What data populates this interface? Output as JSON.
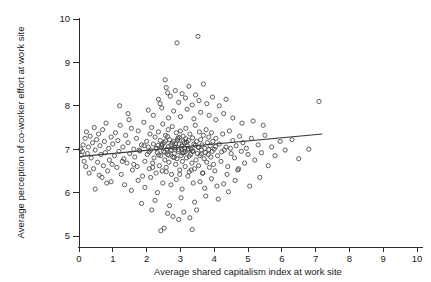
{
  "chart_data": {
    "type": "scatter",
    "title": "",
    "xlabel": "Average shared capitalism index at work site",
    "ylabel": "Average perception of co-worker effort at work site",
    "xlim": [
      0,
      10
    ],
    "ylim": [
      5,
      10
    ],
    "xticks": [
      0,
      1,
      2,
      3,
      4,
      5,
      6,
      7,
      8,
      9,
      10
    ],
    "yticks": [
      5,
      6,
      7,
      8,
      9,
      10
    ],
    "xticklabels": [
      "0",
      "1",
      "2",
      "3",
      "4",
      "5",
      "6",
      "7",
      "8",
      "9",
      "10"
    ],
    "yticklabels": [
      "5",
      "6",
      "7",
      "8",
      "9",
      "10"
    ],
    "grid": false,
    "legend": "none",
    "marker": "open-circle",
    "marker_color": "#3a3a3a",
    "marker_radius_px": 2.1,
    "fit_line": {
      "label": "linear fit",
      "color": "#3a3a3a",
      "x_start": 0.0,
      "y_start": 6.83,
      "x_end": 7.2,
      "y_end": 7.35,
      "slope": 0.072,
      "intercept": 6.83
    },
    "n_points": 352,
    "points": [
      [
        0.05,
        7.0
      ],
      [
        0.07,
        6.86
      ],
      [
        0.1,
        6.95
      ],
      [
        0.12,
        7.1
      ],
      [
        0.15,
        6.72
      ],
      [
        0.18,
        7.25
      ],
      [
        0.2,
        6.6
      ],
      [
        0.22,
        7.4
      ],
      [
        0.25,
        6.9
      ],
      [
        0.28,
        7.05
      ],
      [
        0.3,
        6.45
      ],
      [
        0.33,
        7.3
      ],
      [
        0.36,
        6.8
      ],
      [
        0.4,
        7.15
      ],
      [
        0.43,
        6.55
      ],
      [
        0.45,
        7.5
      ],
      [
        0.48,
        6.98
      ],
      [
        0.52,
        7.22
      ],
      [
        0.55,
        6.7
      ],
      [
        0.58,
        7.35
      ],
      [
        0.6,
        6.4
      ],
      [
        0.62,
        7.08
      ],
      [
        0.65,
        6.88
      ],
      [
        0.7,
        7.45
      ],
      [
        0.72,
        6.62
      ],
      [
        0.75,
        7.18
      ],
      [
        0.78,
        6.92
      ],
      [
        0.8,
        7.6
      ],
      [
        0.85,
        6.5
      ],
      [
        0.88,
        7.02
      ],
      [
        0.9,
        6.75
      ],
      [
        0.95,
        7.28
      ],
      [
        0.98,
        6.65
      ],
      [
        1.0,
        7.12
      ],
      [
        1.05,
        6.85
      ],
      [
        1.08,
        7.38
      ],
      [
        1.12,
        6.58
      ],
      [
        1.15,
        7.2
      ],
      [
        1.18,
        6.95
      ],
      [
        1.22,
        7.55
      ],
      [
        1.25,
        6.42
      ],
      [
        1.3,
        7.05
      ],
      [
        1.33,
        6.78
      ],
      [
        1.38,
        7.32
      ],
      [
        1.42,
        6.68
      ],
      [
        1.45,
        7.15
      ],
      [
        1.5,
        6.9
      ],
      [
        1.55,
        7.48
      ],
      [
        1.58,
        6.52
      ],
      [
        1.62,
        7.0
      ],
      [
        1.65,
        6.82
      ],
      [
        1.7,
        7.25
      ],
      [
        1.72,
        6.6
      ],
      [
        1.75,
        7.42
      ],
      [
        1.8,
        6.96
      ],
      [
        1.85,
        7.1
      ],
      [
        1.88,
        6.38
      ],
      [
        1.92,
        7.62
      ],
      [
        1.95,
        6.72
      ],
      [
        2.0,
        7.18
      ],
      [
        2.02,
        6.88
      ],
      [
        2.05,
        7.05
      ],
      [
        2.08,
        6.55
      ],
      [
        2.1,
        7.35
      ],
      [
        2.12,
        6.98
      ],
      [
        2.15,
        7.5
      ],
      [
        2.18,
        6.68
      ],
      [
        2.2,
        7.12
      ],
      [
        2.22,
        6.8
      ],
      [
        2.25,
        7.28
      ],
      [
        2.28,
        6.45
      ],
      [
        2.3,
        7.02
      ],
      [
        2.32,
        6.92
      ],
      [
        2.35,
        7.4
      ],
      [
        2.38,
        6.62
      ],
      [
        2.4,
        7.2
      ],
      [
        2.42,
        6.85
      ],
      [
        2.45,
        7.08
      ],
      [
        2.46,
        6.5
      ],
      [
        2.48,
        7.58
      ],
      [
        2.5,
        6.95
      ],
      [
        2.52,
        7.15
      ],
      [
        2.54,
        6.75
      ],
      [
        2.56,
        7.32
      ],
      [
        2.58,
        6.58
      ],
      [
        2.6,
        7.0
      ],
      [
        2.62,
        6.88
      ],
      [
        2.64,
        7.45
      ],
      [
        2.66,
        6.7
      ],
      [
        2.68,
        7.22
      ],
      [
        2.7,
        6.98
      ],
      [
        2.72,
        7.1
      ],
      [
        2.74,
        6.42
      ],
      [
        2.76,
        7.52
      ],
      [
        2.78,
        6.82
      ],
      [
        2.8,
        7.18
      ],
      [
        2.82,
        6.9
      ],
      [
        2.84,
        7.05
      ],
      [
        2.86,
        6.65
      ],
      [
        2.88,
        7.38
      ],
      [
        2.9,
        6.78
      ],
      [
        2.92,
        7.25
      ],
      [
        2.94,
        6.95
      ],
      [
        2.96,
        7.12
      ],
      [
        2.98,
        6.52
      ],
      [
        3.0,
        7.42
      ],
      [
        3.02,
        6.85
      ],
      [
        3.04,
        7.02
      ],
      [
        3.06,
        6.72
      ],
      [
        3.08,
        7.3
      ],
      [
        3.1,
        6.92
      ],
      [
        3.12,
        7.15
      ],
      [
        3.14,
        6.6
      ],
      [
        3.16,
        7.48
      ],
      [
        3.18,
        6.8
      ],
      [
        3.2,
        7.08
      ],
      [
        3.22,
        6.98
      ],
      [
        3.24,
        7.2
      ],
      [
        3.26,
        6.48
      ],
      [
        3.28,
        7.35
      ],
      [
        3.3,
        6.88
      ],
      [
        3.32,
        7.0
      ],
      [
        3.34,
        6.68
      ],
      [
        3.36,
        7.26
      ],
      [
        3.38,
        6.95
      ],
      [
        3.4,
        7.12
      ],
      [
        3.42,
        6.55
      ],
      [
        3.44,
        7.55
      ],
      [
        3.46,
        6.75
      ],
      [
        3.48,
        7.18
      ],
      [
        3.5,
        6.9
      ],
      [
        3.52,
        7.05
      ],
      [
        3.54,
        6.62
      ],
      [
        3.56,
        7.4
      ],
      [
        3.58,
        6.85
      ],
      [
        3.6,
        7.22
      ],
      [
        3.62,
        6.98
      ],
      [
        3.64,
        7.1
      ],
      [
        3.66,
        6.45
      ],
      [
        3.68,
        7.32
      ],
      [
        3.7,
        6.78
      ],
      [
        3.72,
        7.02
      ],
      [
        3.74,
        6.92
      ],
      [
        3.76,
        7.45
      ],
      [
        3.78,
        6.7
      ],
      [
        3.8,
        7.15
      ],
      [
        3.82,
        6.88
      ],
      [
        3.84,
        7.28
      ],
      [
        3.86,
        6.58
      ],
      [
        3.88,
        7.08
      ],
      [
        3.9,
        6.82
      ],
      [
        3.92,
        7.38
      ],
      [
        3.94,
        6.95
      ],
      [
        3.96,
        7.18
      ],
      [
        3.98,
        6.65
      ],
      [
        4.0,
        7.0
      ],
      [
        4.05,
        7.25
      ],
      [
        4.1,
        6.85
      ],
      [
        4.15,
        7.12
      ],
      [
        4.2,
        6.72
      ],
      [
        4.25,
        7.35
      ],
      [
        4.3,
        6.98
      ],
      [
        4.35,
        7.05
      ],
      [
        4.4,
        6.6
      ],
      [
        4.45,
        7.42
      ],
      [
        4.5,
        6.9
      ],
      [
        4.55,
        7.2
      ],
      [
        4.6,
        6.8
      ],
      [
        4.65,
        7.08
      ],
      [
        4.7,
        6.52
      ],
      [
        4.75,
        7.3
      ],
      [
        4.8,
        6.95
      ],
      [
        4.85,
        7.15
      ],
      [
        4.9,
        6.68
      ],
      [
        4.95,
        7.02
      ],
      [
        5.0,
        6.88
      ],
      [
        5.1,
        7.25
      ],
      [
        5.2,
        6.75
      ],
      [
        5.3,
        7.1
      ],
      [
        5.4,
        6.92
      ],
      [
        5.5,
        7.32
      ],
      [
        5.6,
        6.62
      ],
      [
        5.7,
        7.05
      ],
      [
        5.8,
        6.85
      ],
      [
        5.95,
        7.18
      ],
      [
        6.1,
        6.98
      ],
      [
        6.3,
        7.22
      ],
      [
        6.5,
        6.78
      ],
      [
        6.8,
        7.0
      ],
      [
        7.1,
        8.1
      ],
      [
        2.35,
        8.15
      ],
      [
        2.4,
        8.05
      ],
      [
        2.55,
        8.6
      ],
      [
        2.58,
        8.42
      ],
      [
        2.62,
        8.3
      ],
      [
        2.7,
        8.22
      ],
      [
        2.85,
        8.35
      ],
      [
        2.95,
        8.08
      ],
      [
        3.05,
        8.28
      ],
      [
        3.15,
        8.18
      ],
      [
        3.25,
        8.45
      ],
      [
        3.35,
        8.02
      ],
      [
        3.45,
        8.25
      ],
      [
        3.55,
        8.12
      ],
      [
        3.68,
        8.5
      ],
      [
        3.78,
        8.05
      ],
      [
        3.95,
        8.2
      ],
      [
        4.15,
        8.0
      ],
      [
        4.35,
        8.15
      ],
      [
        2.9,
        9.45
      ],
      [
        3.52,
        9.6
      ],
      [
        1.2,
        8.0
      ],
      [
        1.45,
        7.82
      ],
      [
        1.48,
        7.68
      ],
      [
        2.05,
        7.9
      ],
      [
        2.2,
        7.78
      ],
      [
        2.45,
        7.95
      ],
      [
        2.65,
        7.72
      ],
      [
        2.8,
        7.88
      ],
      [
        3.0,
        7.75
      ],
      [
        3.2,
        7.92
      ],
      [
        3.4,
        7.7
      ],
      [
        3.6,
        7.85
      ],
      [
        3.85,
        7.78
      ],
      [
        4.05,
        7.68
      ],
      [
        4.28,
        7.82
      ],
      [
        4.55,
        7.72
      ],
      [
        4.82,
        7.6
      ],
      [
        5.15,
        7.65
      ],
      [
        5.45,
        7.55
      ],
      [
        2.42,
        5.12
      ],
      [
        2.52,
        5.18
      ],
      [
        3.35,
        5.15
      ],
      [
        2.15,
        5.6
      ],
      [
        2.62,
        5.52
      ],
      [
        2.78,
        5.45
      ],
      [
        2.95,
        5.38
      ],
      [
        3.1,
        5.55
      ],
      [
        3.28,
        5.42
      ],
      [
        3.48,
        5.6
      ],
      [
        1.85,
        5.75
      ],
      [
        2.25,
        5.82
      ],
      [
        2.68,
        5.7
      ],
      [
        3.02,
        5.88
      ],
      [
        3.42,
        5.78
      ],
      [
        3.75,
        5.92
      ],
      [
        4.12,
        5.85
      ],
      [
        1.55,
        6.05
      ],
      [
        1.95,
        6.12
      ],
      [
        2.32,
        6.0
      ],
      [
        2.72,
        6.18
      ],
      [
        3.05,
        6.08
      ],
      [
        3.38,
        6.22
      ],
      [
        3.72,
        6.1
      ],
      [
        4.08,
        6.15
      ],
      [
        4.42,
        6.02
      ],
      [
        0.95,
        6.25
      ],
      [
        1.35,
        6.18
      ],
      [
        1.75,
        6.28
      ],
      [
        2.12,
        6.35
      ],
      [
        2.48,
        6.22
      ],
      [
        2.88,
        6.3
      ],
      [
        3.22,
        6.38
      ],
      [
        3.58,
        6.25
      ],
      [
        3.92,
        6.32
      ],
      [
        4.28,
        6.2
      ],
      [
        4.62,
        6.28
      ],
      [
        5.05,
        6.15
      ],
      [
        5.35,
        6.35
      ],
      [
        2.58,
        6.48
      ],
      [
        2.98,
        6.42
      ],
      [
        3.32,
        6.52
      ],
      [
        3.66,
        6.45
      ],
      [
        4.02,
        6.5
      ],
      [
        4.38,
        6.42
      ],
      [
        4.72,
        6.55
      ],
      [
        2.18,
        6.58
      ],
      [
        1.62,
        6.65
      ],
      [
        1.28,
        6.72
      ],
      [
        0.68,
        6.35
      ],
      [
        0.82,
        6.22
      ],
      [
        0.48,
        6.08
      ],
      [
        2.44,
        7.04
      ],
      [
        2.64,
        7.06
      ],
      [
        2.84,
        7.03
      ],
      [
        3.04,
        7.07
      ],
      [
        3.24,
        7.01
      ],
      [
        2.74,
        6.97
      ],
      [
        2.94,
        6.99
      ],
      [
        3.14,
        6.94
      ],
      [
        2.54,
        6.93
      ],
      [
        2.34,
        7.09
      ],
      [
        2.86,
        7.13
      ],
      [
        3.06,
        6.91
      ],
      [
        3.18,
        7.16
      ],
      [
        2.66,
        6.86
      ],
      [
        2.46,
        7.11
      ],
      [
        3.36,
        6.96
      ],
      [
        3.12,
        7.03
      ],
      [
        2.92,
        7.21
      ],
      [
        2.76,
        7.14
      ],
      [
        3.44,
        7.09
      ],
      [
        2.56,
        7.19
      ],
      [
        2.36,
        6.87
      ],
      [
        3.26,
        6.84
      ],
      [
        2.82,
        6.81
      ],
      [
        3.08,
        7.19
      ],
      [
        2.96,
        7.27
      ],
      [
        3.16,
        7.24
      ],
      [
        2.62,
        7.29
      ],
      [
        3.54,
        7.04
      ],
      [
        3.62,
        6.89
      ],
      [
        2.28,
        7.02
      ],
      [
        2.08,
        6.94
      ],
      [
        3.84,
        6.99
      ],
      [
        4.04,
        7.06
      ],
      [
        1.92,
        7.08
      ],
      [
        4.22,
        6.94
      ],
      [
        1.78,
        6.98
      ],
      [
        4.48,
        7.02
      ]
    ]
  }
}
